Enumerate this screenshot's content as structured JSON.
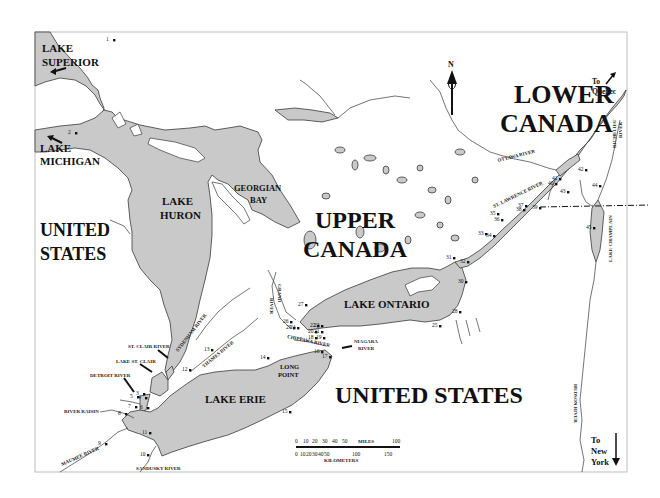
{
  "map": {
    "regions": {
      "lower_canada": [
        "LOWER",
        "CANADA"
      ],
      "upper_canada": [
        "UPPER",
        "CANADA"
      ],
      "united_states_west": [
        "UNITED",
        "STATES"
      ],
      "united_states_south": "UNITED STATES"
    },
    "lakes": {
      "superior": [
        "LAKE",
        "SUPERIOR"
      ],
      "michigan": [
        "LAKE",
        "MICHIGAN"
      ],
      "huron": [
        "LAKE",
        "HURON"
      ],
      "georgian_bay": [
        "GEORGIAN",
        "BAY"
      ],
      "ontario": "LAKE ONTARIO",
      "erie": "LAKE ERIE",
      "st_clair": "LAKE ST. CLAIR",
      "champlain": "LAKE CHAMPLAIN"
    },
    "features": {
      "long_point": [
        "LONG",
        "POINT"
      ]
    },
    "rivers": {
      "ottawa": "OTTAWA RIVER",
      "st_lawrence": "ST. LAWRENCE RIVER",
      "richelieu": [
        "RICHELIEU",
        "RIVER"
      ],
      "hudson": "HUDSON RIVER",
      "niagara": [
        "NIAGARA",
        "RIVER"
      ],
      "chippawa": "CHIPPAWA RIVER",
      "grand": [
        "GRAND",
        "RIVER"
      ],
      "thames": "THAMES RIVER",
      "sydenham": "SYDENHAM RIVER",
      "st_clair": "ST. CLAIR RIVER",
      "detroit": "DETROIT RIVER",
      "raisin": "RIVER RAISIN",
      "maumee": "MAUMEE RIVER",
      "sandusky": "SANDUSKY RIVER"
    },
    "directions": {
      "north": "N",
      "quebec": [
        "To",
        "Quebec"
      ],
      "new_york": [
        "To",
        "New",
        "York"
      ]
    },
    "scale": {
      "miles_label": "MILES",
      "km_label": "KILOMETERS",
      "miles_ticks": [
        "0",
        "10",
        "20",
        "30",
        "40",
        "50",
        "100"
      ],
      "km_ticks": [
        "0",
        "10",
        "20",
        "30",
        "40",
        "50",
        "100",
        "150"
      ]
    },
    "sites": [
      {
        "n": "1"
      },
      {
        "n": "2"
      },
      {
        "n": "3"
      },
      {
        "n": "4"
      },
      {
        "n": "5"
      },
      {
        "n": "6"
      },
      {
        "n": "7"
      },
      {
        "n": "8"
      },
      {
        "n": "9"
      },
      {
        "n": "10"
      },
      {
        "n": "11"
      },
      {
        "n": "12"
      },
      {
        "n": "13"
      },
      {
        "n": "14"
      },
      {
        "n": "15"
      },
      {
        "n": "16"
      },
      {
        "n": "17"
      },
      {
        "n": "18"
      },
      {
        "n": "19"
      },
      {
        "n": "20"
      },
      {
        "n": "21"
      },
      {
        "n": "22"
      },
      {
        "n": "23"
      },
      {
        "n": "24"
      },
      {
        "n": "25"
      },
      {
        "n": "26"
      },
      {
        "n": "27"
      },
      {
        "n": "28"
      },
      {
        "n": "29"
      },
      {
        "n": "30"
      },
      {
        "n": "31"
      },
      {
        "n": "32"
      },
      {
        "n": "33"
      },
      {
        "n": "34"
      },
      {
        "n": "35"
      },
      {
        "n": "36"
      },
      {
        "n": "37"
      },
      {
        "n": "38"
      },
      {
        "n": "39"
      },
      {
        "n": "40"
      },
      {
        "n": "41"
      },
      {
        "n": "42"
      },
      {
        "n": "43"
      },
      {
        "n": "44"
      },
      {
        "n": "45"
      }
    ]
  }
}
